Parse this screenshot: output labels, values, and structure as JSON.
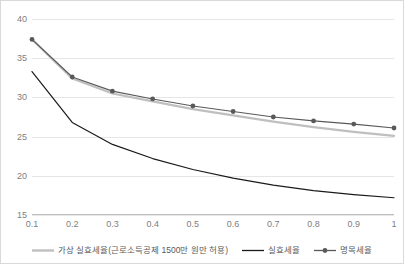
{
  "chart_data": {
    "type": "line",
    "title": "",
    "subtitle": "",
    "xlabel": "",
    "ylabel": "",
    "x": [
      0.1,
      0.2,
      0.3,
      0.4,
      0.5,
      0.6,
      0.7,
      0.8,
      0.9,
      1
    ],
    "xtick_labels": [
      "0.1",
      "0.2",
      "0.3",
      "0.4",
      "0.5",
      "0.6",
      "0.7",
      "0.8",
      "0.9",
      "1"
    ],
    "ytick_labels": [
      "15",
      "20",
      "25",
      "30",
      "35",
      "40"
    ],
    "yticks": [
      15,
      20,
      25,
      30,
      35,
      40
    ],
    "ylim": [
      15,
      40
    ],
    "xlim": [
      0.1,
      1
    ],
    "grid": true,
    "legend_position": "bottom",
    "series": [
      {
        "name": "가상 실효세율(근로소득공제 1500만 원만 허용)",
        "color": "#bfbfbf",
        "marker": "none",
        "values": [
          37.4,
          32.4,
          30.5,
          29.5,
          28.5,
          27.7,
          26.9,
          26.2,
          25.6,
          25.1
        ]
      },
      {
        "name": "실효세율",
        "color": "#1a1a1a",
        "marker": "none",
        "values": [
          33.3,
          26.8,
          24.0,
          22.2,
          20.8,
          19.7,
          18.8,
          18.1,
          17.6,
          17.2
        ]
      },
      {
        "name": "명목세율",
        "color": "#595959",
        "marker": "circle",
        "values": [
          37.4,
          32.6,
          30.8,
          29.8,
          28.9,
          28.2,
          27.5,
          27.0,
          26.6,
          26.1
        ]
      }
    ]
  },
  "legend": {
    "items": [
      {
        "label": "가상 실효세율(근로소득공제 1500만 원만 허용)",
        "color": "#bfbfbf",
        "marker": "none"
      },
      {
        "label": "실효세율",
        "color": "#1a1a1a",
        "marker": "none"
      },
      {
        "label": "명목세율",
        "color": "#595959",
        "marker": "circle"
      }
    ]
  },
  "colors": {
    "gridline": "#e6e6e6",
    "axis": "#bfbfbf",
    "tick_text": "#808080",
    "border": "#d9d9d9",
    "background": "#ffffff"
  }
}
